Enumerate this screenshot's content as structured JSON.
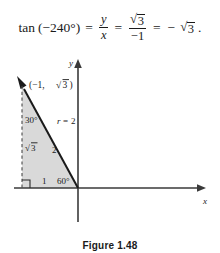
{
  "equation": {
    "function_name": "tan",
    "argument": "(−240°)",
    "equals_1": "=",
    "fraction_1": {
      "numerator": "y",
      "denominator": "x"
    },
    "equals_2": "=",
    "fraction_2": {
      "numerator_surd": "√",
      "numerator_radicand": "3",
      "denominator": "−1"
    },
    "equals_3": "=",
    "minus": "−",
    "result_surd": "√",
    "result_radicand": "3",
    "period": "."
  },
  "figure": {
    "caption": "Figure 1.48",
    "y_axis_label": "y",
    "x_axis_label": "x",
    "point_label": "(−1, √3 )",
    "point_label_open": "(−1, ",
    "point_label_surd": "√",
    "point_label_radicand": "3",
    "point_label_close": " )",
    "angle_top_label": "30°",
    "angle_bottom_label": "60°",
    "radius_label_var": "r",
    "radius_label_eq": "=",
    "radius_label_value": "2",
    "side_vertical_surd": "√",
    "side_vertical_radicand": "3",
    "side_hypotenuse": "2",
    "side_horizontal": "1",
    "shade_color": "#d8d8d8",
    "line_color": "#1a1a1a",
    "axis_color": "#3a3a3a"
  }
}
